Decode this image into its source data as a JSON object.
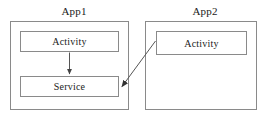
{
  "diagram": {
    "type": "block-diagram",
    "title": "",
    "apps": [
      {
        "id": "app1",
        "label": "App1",
        "nodes": [
          {
            "id": "app1-activity",
            "label": "Activity"
          },
          {
            "id": "app1-service",
            "label": "Service"
          }
        ]
      },
      {
        "id": "app2",
        "label": "App2",
        "nodes": [
          {
            "id": "app2-activity",
            "label": "Activity"
          }
        ]
      }
    ],
    "arrows": [
      {
        "id": "arrow-activity-to-service",
        "from": "app1-activity",
        "to": "app1-service",
        "label": "",
        "style": "solid",
        "direction": "vertical-down"
      },
      {
        "id": "arrow-app2-activity-to-app1-service",
        "from": "app2-activity",
        "to": "app1-service",
        "label": "",
        "style": "solid",
        "direction": "diagonal-down-left"
      }
    ],
    "colors": {
      "stroke": "#8a8a8a",
      "arrow": "#555555",
      "text": "#1a1a1a",
      "background": "#ffffff"
    }
  }
}
